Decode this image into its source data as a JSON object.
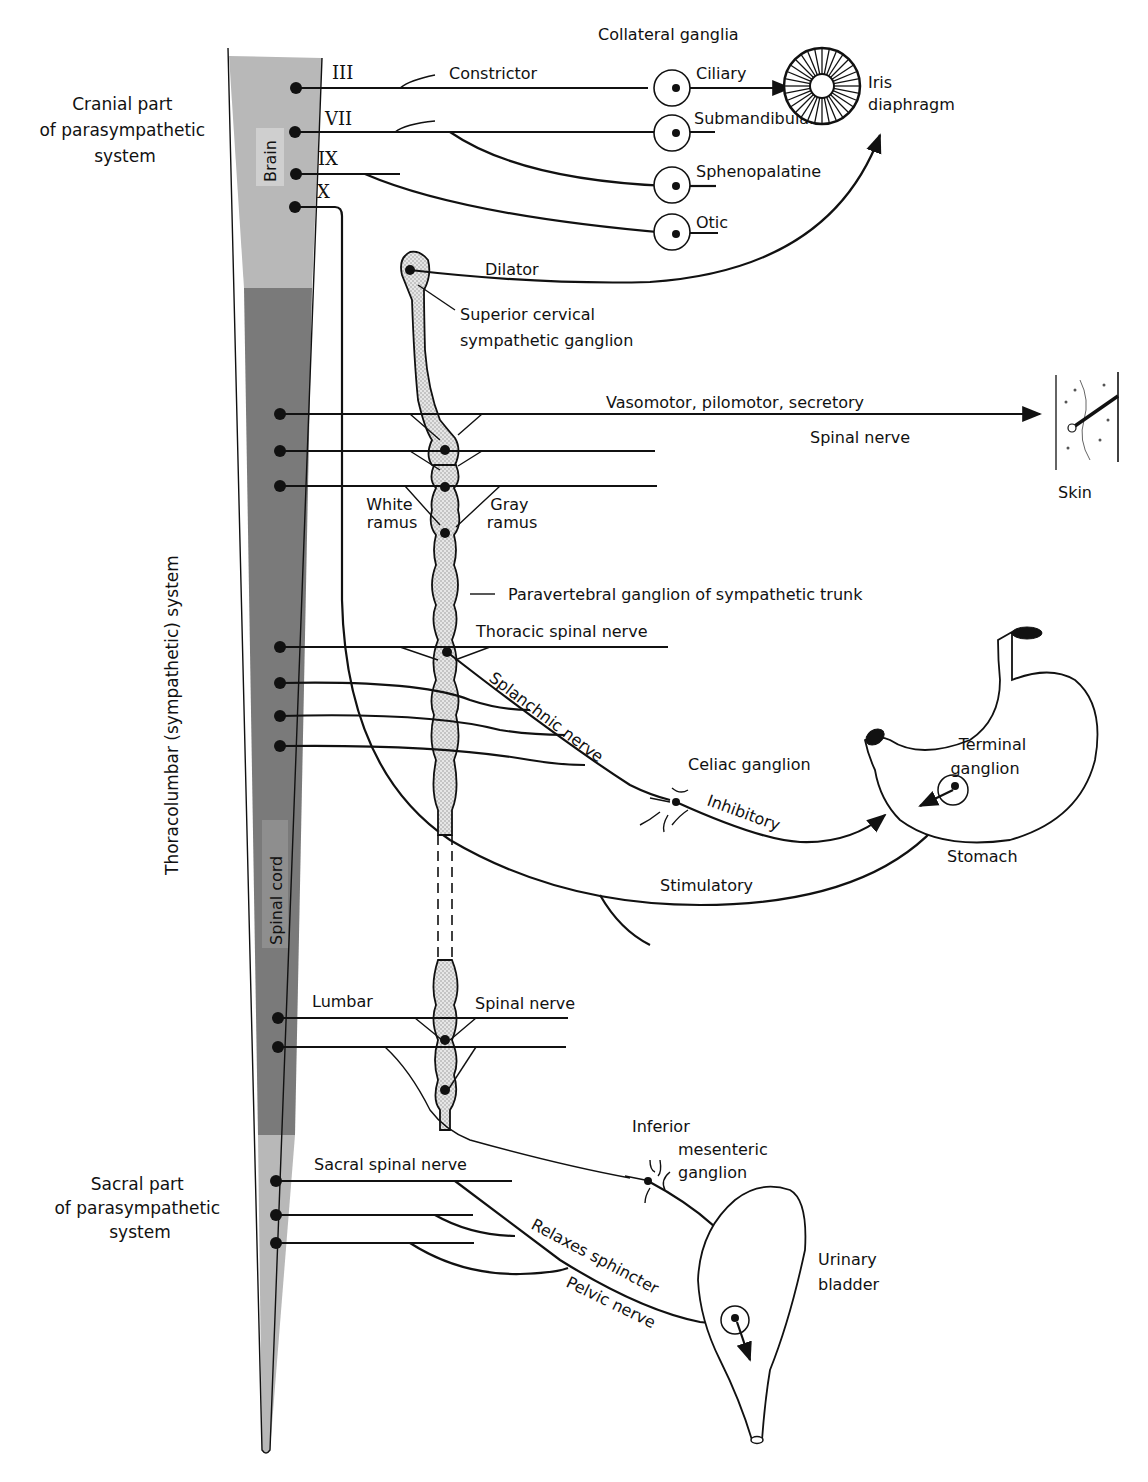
{
  "regions": {
    "cranial": "Cranial part of parasympathetic system",
    "cranial_lines": [
      "Cranial part",
      "of parasympathetic",
      "system"
    ],
    "thoracolumbar": "Thoracolumbar (sympathetic) system",
    "sacral": "Sacral part of parasympathetic system",
    "sacral_lines": [
      "Sacral part",
      "of parasympathetic",
      "system"
    ]
  },
  "cord": {
    "brain_label": "Brain",
    "spinal_label": "Spinal cord",
    "colors": {
      "cranial": "#b8b8b8",
      "thoracolumbar": "#7a7a7a",
      "sacral": "#b8b8b8"
    }
  },
  "cranial_nerves": [
    "III",
    "VII",
    "IX",
    "X"
  ],
  "collateral_ganglia": {
    "heading": "Collateral ganglia",
    "items": [
      "Ciliary",
      "Submandibular",
      "Sphenopalatine",
      "Otic"
    ]
  },
  "labels": {
    "constrictor": "Constrictor",
    "iris": [
      "Iris",
      "diaphragm"
    ],
    "dilator": "Dilator",
    "superior_cervical": [
      "Superior cervical",
      "sympathetic ganglion"
    ],
    "vasomotor": "Vasomotor, pilomotor, secretory",
    "spinal_nerve_upper": "Spinal nerve",
    "skin": "Skin",
    "white_ramus": [
      "White",
      "ramus"
    ],
    "gray_ramus": [
      "Gray",
      "ramus"
    ],
    "paravertebral": "Paravertebral ganglion of sympathetic trunk",
    "thoracic_spinal_nerve": "Thoracic spinal nerve",
    "splanchnic": "Splanchnic nerve",
    "celiac": "Celiac ganglion",
    "inhibitory": "Inhibitory",
    "terminal_ganglion": [
      "Terminal",
      "ganglion"
    ],
    "stomach": "Stomach",
    "stimulatory": "Stimulatory",
    "lumbar": "Lumbar",
    "spinal_nerve_lower": "Spinal nerve",
    "inferior_mesenteric": [
      "Inferior",
      "mesenteric",
      "ganglion"
    ],
    "sacral_spinal_nerve": "Sacral spinal nerve",
    "contracts": "Contracts",
    "relaxes_sphincter": "Relaxes sphincter",
    "pelvic_nerve": "Pelvic nerve",
    "urinary_bladder": [
      "Urinary",
      "bladder"
    ]
  }
}
